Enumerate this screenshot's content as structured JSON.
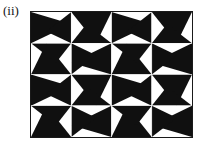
{
  "figure": {
    "label": "(ii)",
    "kind": "black-and-white-pinwheel-tessellation",
    "colors": {
      "ink": "#101010",
      "paper": "#ffffff",
      "frame_stroke": "#1a1a1a",
      "seam": "#ffffff"
    },
    "frame": {
      "x": 30,
      "y": 11,
      "width": 163,
      "height": 127,
      "border_width": 1.4
    },
    "grid": {
      "columns": 4,
      "rows": 4,
      "cell_width": 40.25,
      "cell_height": 31.25,
      "seam_width": 0.9
    },
    "motif": {
      "name": "two-triangle-wedge",
      "note": "Each unit square contains a large solid black triangle and a smaller solid black wedge separated by a white triangle, producing a spinning pinwheel when four squares meet.",
      "black_polygon_a": "0,0 100,38 0,100",
      "black_polygon_b": "100,0 100,100 38,62",
      "background": "#ffffff"
    },
    "cell_rotations_deg": [
      [
        0,
        90,
        0,
        90
      ],
      [
        270,
        180,
        270,
        180
      ],
      [
        0,
        90,
        0,
        90
      ],
      [
        270,
        180,
        270,
        180
      ]
    ]
  }
}
